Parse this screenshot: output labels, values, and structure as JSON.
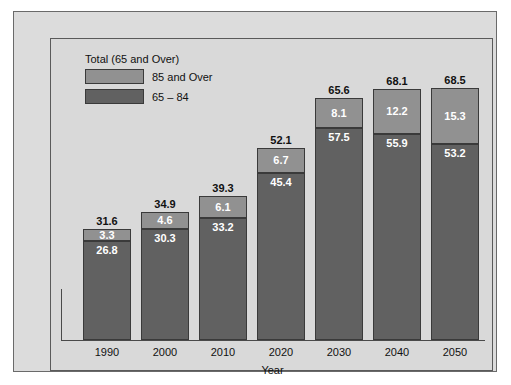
{
  "chart_data": {
    "type": "bar",
    "subtype": "stacked-bar",
    "title": "",
    "xlabel": "Year",
    "ylabel": "",
    "categories": [
      "1990",
      "2000",
      "2010",
      "2020",
      "2030",
      "2040",
      "2050"
    ],
    "series": [
      {
        "name": "65 – 84",
        "color": "#616161",
        "values": [
          26.8,
          30.3,
          33.2,
          45.4,
          57.5,
          55.9,
          53.2
        ]
      },
      {
        "name": "85 and Over",
        "color": "#919191",
        "values": [
          3.3,
          4.6,
          6.1,
          6.7,
          8.1,
          12.2,
          15.3
        ]
      }
    ],
    "totals": [
      31.6,
      34.9,
      39.3,
      52.1,
      65.6,
      68.1,
      68.5
    ],
    "totals_label": "Total (65 and Over)",
    "ylim": [
      0,
      68.5
    ],
    "grid": false,
    "legend_position": "top-left"
  },
  "legend": {
    "title": "Total (65 and Over)",
    "entries": [
      {
        "label": "85 and Over",
        "color": "#919191"
      },
      {
        "label": "65 – 84",
        "color": "#616161"
      }
    ]
  },
  "axis": {
    "x_title": "Year",
    "x_ticks": [
      "1990",
      "2000",
      "2010",
      "2020",
      "2030",
      "2040",
      "2050"
    ]
  },
  "bars": [
    {
      "year": "1990",
      "total": "31.6",
      "top": "3.3",
      "bottom": "26.8"
    },
    {
      "year": "2000",
      "total": "34.9",
      "top": "4.6",
      "bottom": "30.3"
    },
    {
      "year": "2010",
      "total": "39.3",
      "top": "6.1",
      "bottom": "33.2"
    },
    {
      "year": "2020",
      "total": "52.1",
      "top": "6.7",
      "bottom": "45.4"
    },
    {
      "year": "2030",
      "total": "65.6",
      "top": "8.1",
      "bottom": "57.5"
    },
    {
      "year": "2040",
      "total": "68.1",
      "top": "12.2",
      "bottom": "55.9"
    },
    {
      "year": "2050",
      "total": "68.5",
      "top": "15.3",
      "bottom": "53.2"
    }
  ]
}
